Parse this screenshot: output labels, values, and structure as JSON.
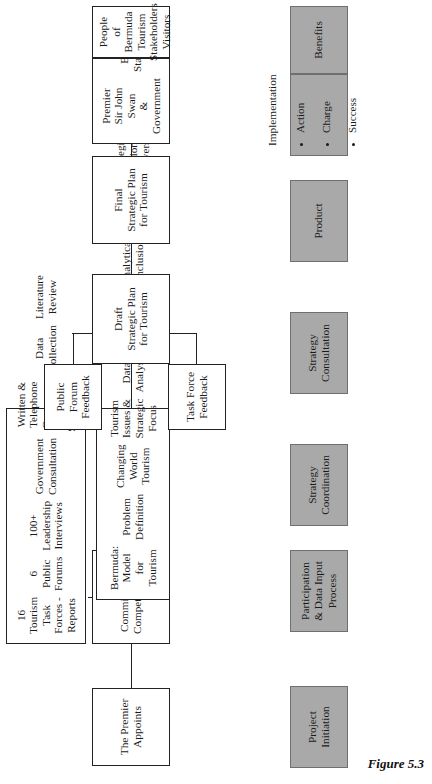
{
  "figure": {
    "caption": "Figure 5.3"
  },
  "nodes": {
    "premier_appoints": {
      "text": "The Premier\nAppoints"
    },
    "commission": {
      "items": [
        "Commission on\nCompetitiveness",
        "Tourism Planning\nCommittee"
      ]
    },
    "participation": {
      "items": [
        "16 Tourism Task\nForces - Reports",
        "6 Public Forums",
        "100+ Leadership\nInterviews",
        "Government\nConsultation",
        "Written &\nTelephone\nComments &\nSuggestions",
        "Data Collection",
        "Literature Review"
      ]
    },
    "coordination": {
      "items": [
        "Bermuda:\nModel for Tourism",
        "Problem Definition",
        "Changing World\nTourism",
        "Tourism Issues &\nStrategic Focus",
        "Data Analysis",
        "Framework for\nTourism",
        "Analytical\nConclusions",
        "Managing Tourism",
        "Strategic Action\nDrivers",
        "Strategic Actions"
      ]
    },
    "public_forum_feedback": {
      "text": "Public Forum\nFeedback"
    },
    "task_force_feedback": {
      "text": "Task Force\nFeedback"
    },
    "draft_plan": {
      "text": "Draft\nStrategic Plan\nfor Tourism"
    },
    "final_plan": {
      "text": "Final\nStrategic Plan\nfor Tourism"
    },
    "government": {
      "items": [
        "Premier\nSir John Swan\n& Government",
        "Bermuda\nStakeholders"
      ]
    },
    "stakeholders": {
      "items": [
        "People of\nBermuda",
        "Tourism\nStakeholders",
        "Visitors"
      ]
    }
  },
  "stages": {
    "project_initiation": {
      "label": "Project\nInitiation"
    },
    "participation": {
      "label": "Participation\n& Data Input\nProcess"
    },
    "strategy_coordination": {
      "label": "Strategy\nCoordination"
    },
    "strategy_consultation": {
      "label": "Strategy\nConsultation"
    },
    "product": {
      "label": "Product"
    },
    "implementation": {
      "title": "Implementation",
      "bullets": [
        "Action",
        "Charge",
        "Success"
      ]
    },
    "benefits": {
      "label": "Benefits"
    }
  },
  "colors": {
    "stage_fill": "#a9a9a9",
    "stage_border": "#6f6f6f",
    "node_border": "#222222",
    "background": "#ffffff"
  }
}
